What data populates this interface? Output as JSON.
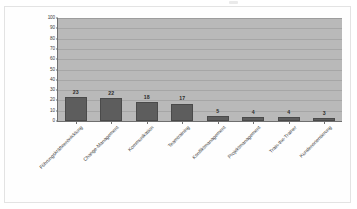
{
  "chart_data": {
    "type": "bar",
    "title": "",
    "subtitle": "",
    "xlabel": "",
    "ylabel": "",
    "ylim": [
      0,
      100
    ],
    "ytick_step": 10,
    "yticks": [
      "100",
      "90",
      "80",
      "70",
      "60",
      "50",
      "40",
      "30",
      "20",
      "10",
      "0"
    ],
    "grid": true,
    "legend": false,
    "legend_position": "none",
    "categories": [
      "Führungskräfteentwicklung",
      "Change-Management",
      "Kommunikation",
      "Teamtraining",
      "Konfliktmanagement",
      "Projektmanagement",
      "Train-the-Trainer",
      "Kundenorientierung"
    ],
    "values": [
      23,
      22,
      18,
      17,
      5,
      4,
      4,
      3
    ],
    "value_labels": [
      "23",
      "22",
      "18",
      "17",
      "5",
      "4",
      "4",
      "3"
    ],
    "colors": {
      "bar_fill": "#5d5d5d",
      "bar_border": "#4a4a4a",
      "plot_background": "#b9b9b9",
      "gridline": "#a6a6a6",
      "axis_line": "#6f6f6f",
      "page_background": "#ffffff",
      "frame_border": "#e3e3e3",
      "tick_text": "#3a3a3a",
      "label_text": "#3f3f3f"
    }
  }
}
